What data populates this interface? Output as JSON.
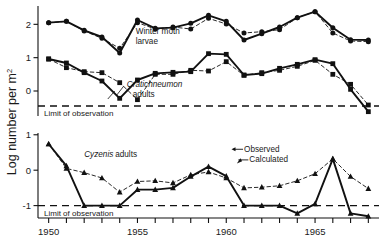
{
  "figure": {
    "y_axis_label": "Log number per m",
    "y_axis_label_sup": "2",
    "limit_text": "Limit of observation",
    "colors": {
      "ink": "#111111",
      "dashed": "#333333"
    }
  },
  "x_axis": {
    "min": 1949.4,
    "max": 1968.6,
    "tick_years": [
      1950,
      1951,
      1952,
      1953,
      1954,
      1955,
      1956,
      1957,
      1958,
      1959,
      1960,
      1961,
      1962,
      1963,
      1964,
      1965,
      1966,
      1967,
      1968
    ],
    "labeled_ticks": [
      {
        "year": 1950,
        "label": "1950"
      },
      {
        "year": 1955,
        "label": "1955"
      },
      {
        "year": 1960,
        "label": "1960"
      },
      {
        "year": 1965,
        "label": "1965"
      }
    ]
  },
  "chart_data": [
    {
      "type": "line",
      "panel": "top",
      "title": "Winter moth larvae and Cratichneumon adults",
      "xlabel": "",
      "ylabel": "Log number per m2",
      "ylim": [
        -0.75,
        2.55
      ],
      "yticks": [
        0,
        1,
        2
      ],
      "ytick_labels": [
        "0",
        "1",
        "2"
      ],
      "grid": false,
      "limit_of_observation": -0.45,
      "annotations": [
        {
          "name": "winter-moth-larvae-label",
          "text_line1": "Winter moth",
          "text_line2": "larvae",
          "x": 1954.9,
          "y": 1.72
        },
        {
          "name": "cratichneumon-label",
          "text_italic": "Cratichneumon",
          "text_plain": "adults",
          "x": 1954.4,
          "y": 0.12
        }
      ],
      "x": [
        1950,
        1951,
        1952,
        1953,
        1954,
        1955,
        1956,
        1957,
        1958,
        1959,
        1960,
        1961,
        1962,
        1963,
        1964,
        1965,
        1966,
        1967,
        1968
      ],
      "series": [
        {
          "name": "Winter moth larvae observed",
          "marker": "circle",
          "linestyle": "solid",
          "values": [
            2.05,
            2.09,
            1.82,
            1.62,
            1.14,
            2.13,
            1.88,
            1.9,
            2.03,
            2.27,
            2.09,
            1.53,
            1.72,
            1.92,
            2.2,
            2.38,
            1.9,
            1.54,
            1.53
          ]
        },
        {
          "name": "Winter moth larvae calculated",
          "marker": "circle",
          "linestyle": "dashed",
          "values": [
            2.05,
            2.09,
            1.8,
            1.58,
            1.28,
            2.05,
            1.86,
            1.92,
            1.86,
            2.18,
            2.01,
            1.74,
            1.78,
            1.84,
            2.2,
            2.38,
            1.74,
            1.5,
            1.48
          ]
        },
        {
          "name": "Cratichneumon adults observed",
          "marker": "square",
          "linestyle": "solid",
          "values": [
            0.96,
            0.84,
            0.55,
            0.3,
            -0.22,
            0.33,
            0.53,
            0.56,
            0.58,
            1.12,
            1.1,
            0.48,
            0.52,
            0.68,
            0.8,
            0.94,
            0.82,
            0.05,
            -0.62
          ]
        },
        {
          "name": "Cratichneumon adults calculated",
          "marker": "square",
          "linestyle": "dashed",
          "values": [
            0.96,
            0.7,
            0.58,
            0.55,
            0.25,
            -0.26,
            0.5,
            0.5,
            0.62,
            0.6,
            0.88,
            0.47,
            0.55,
            0.62,
            0.74,
            0.92,
            0.5,
            0.2,
            -0.42
          ]
        }
      ]
    },
    {
      "type": "line",
      "panel": "bottom",
      "title": "Cyzenis adults",
      "xlabel": "",
      "ylabel": "Log number per m2",
      "ylim": [
        -1.35,
        1.05
      ],
      "yticks": [
        -1,
        0,
        1
      ],
      "ytick_labels": [
        "-1",
        "0",
        "1"
      ],
      "grid": false,
      "limit_of_observation": -1.0,
      "annotations": [
        {
          "name": "cyzenis-label",
          "text_italic": "Cyzenis",
          "text_plain": "adults",
          "x": 1952.0,
          "y": 0.38
        },
        {
          "name": "observed-legend",
          "text": "Observed",
          "x": 1961.0,
          "y": 0.52
        },
        {
          "name": "calculated-legend",
          "text": "Calculated",
          "x": 1961.3,
          "y": 0.22
        }
      ],
      "x": [
        1950,
        1951,
        1952,
        1953,
        1954,
        1955,
        1956,
        1957,
        1958,
        1959,
        1960,
        1961,
        1962,
        1963,
        1964,
        1965,
        1966,
        1967,
        1968
      ],
      "series": [
        {
          "name": "Cyzenis adults observed",
          "marker": "triangle",
          "linestyle": "solid",
          "values": [
            0.74,
            0.12,
            -1.0,
            -1.0,
            -1.0,
            -0.55,
            -0.55,
            -0.5,
            -0.18,
            0.1,
            -0.17,
            -1.0,
            -1.0,
            -1.0,
            -1.22,
            -0.95,
            0.32,
            -1.22,
            -1.3
          ]
        },
        {
          "name": "Cyzenis adults calculated",
          "marker": "triangle",
          "linestyle": "dashed",
          "values": [
            0.74,
            0.05,
            -0.07,
            -0.22,
            -0.62,
            -0.32,
            -0.3,
            -0.36,
            -0.13,
            -0.05,
            -0.22,
            -0.5,
            -0.48,
            -0.44,
            -0.3,
            -0.1,
            0.32,
            -0.18,
            -0.52
          ]
        }
      ]
    }
  ]
}
